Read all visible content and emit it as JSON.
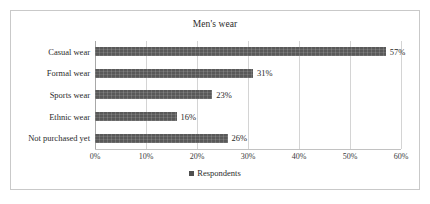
{
  "chart_data": {
    "type": "bar",
    "orientation": "horizontal",
    "title": "Men's wear",
    "xlabel": "",
    "ylabel": "",
    "categories": [
      "Casual wear",
      "Formal wear",
      "Sports wear",
      "Ethnic wear",
      "Not purchased yet"
    ],
    "values": [
      57,
      31,
      23,
      16,
      26
    ],
    "value_labels": [
      "57%",
      "31%",
      "23%",
      "16%",
      "26%"
    ],
    "series": [
      {
        "name": "Respondents",
        "values": [
          57,
          31,
          23,
          16,
          26
        ],
        "color": "#595959"
      }
    ],
    "xlim": [
      0,
      60
    ],
    "xtick_values": [
      0,
      10,
      20,
      30,
      40,
      50,
      60
    ],
    "xtick_labels": [
      "0%",
      "10%",
      "20%",
      "30%",
      "40%",
      "50%",
      "60%"
    ],
    "grid": true,
    "grid_axis": "x",
    "legend": {
      "position": "bottom",
      "entries": [
        {
          "label": "Respondents",
          "color": "#595959"
        }
      ]
    },
    "border_color": "#c9c9c9",
    "gridline_color": "#d4d4d4",
    "text_color": "#2b2b2b"
  }
}
